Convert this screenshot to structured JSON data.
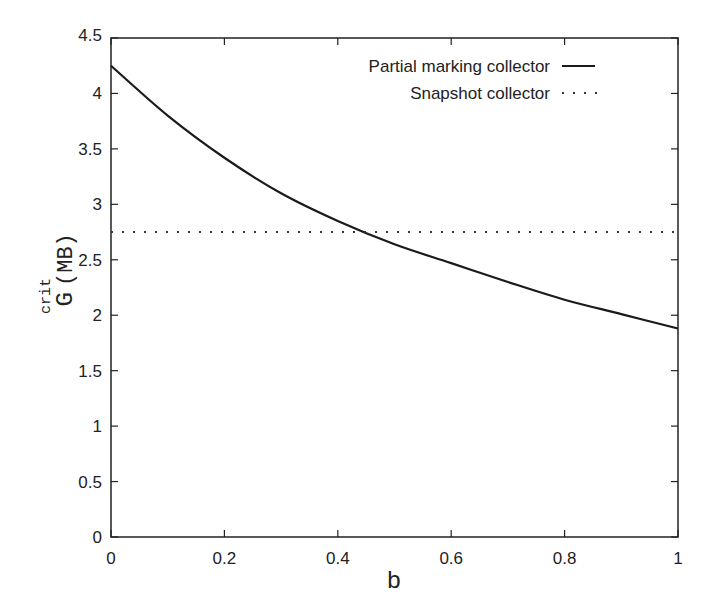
{
  "chart_data": {
    "type": "line",
    "title": "",
    "xlabel": "b",
    "ylabel": "G^crit (MB)",
    "ylabel_parts": {
      "base": "G",
      "sup": "crit",
      "unit": "(MB)"
    },
    "xlim": [
      0,
      1
    ],
    "ylim": [
      0,
      4.5
    ],
    "xticks": [
      0,
      0.2,
      0.4,
      0.6,
      0.8,
      1
    ],
    "xtick_labels": [
      "0",
      "0.2",
      "0.4",
      "0.6",
      "0.8",
      "1"
    ],
    "yticks": [
      0,
      0.5,
      1,
      1.5,
      2,
      2.5,
      3,
      3.5,
      4,
      4.5
    ],
    "ytick_labels": [
      "0",
      "0.5",
      "1",
      "1.5",
      "2",
      "2.5",
      "3",
      "3.5",
      "4",
      "4.5"
    ],
    "grid": false,
    "legend_position": "upper right",
    "series": [
      {
        "name": "Partial marking collector",
        "style": "solid",
        "x": [
          0,
          0.1,
          0.2,
          0.3,
          0.4,
          0.5,
          0.6,
          0.7,
          0.8,
          0.9,
          1.0
        ],
        "values": [
          4.25,
          3.8,
          3.42,
          3.1,
          2.85,
          2.64,
          2.47,
          2.3,
          2.14,
          2.01,
          1.88
        ]
      },
      {
        "name": "Snapshot collector",
        "style": "dotted",
        "x": [
          0,
          1
        ],
        "values": [
          2.75,
          2.75
        ]
      }
    ]
  },
  "legend": {
    "items": [
      {
        "label": "Partial marking collector"
      },
      {
        "label": "Snapshot collector"
      }
    ]
  }
}
